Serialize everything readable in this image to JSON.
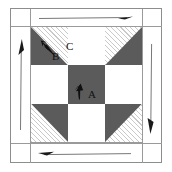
{
  "figure": {
    "colors": {
      "dark_patch": "#5b5b5b",
      "light_patch": "#ffffff",
      "hatched_patch": "#f4f4f4",
      "hatch_line": "#c9c9c9",
      "frame_line": "#8d8d8d",
      "arrow": "#1a1a1a",
      "label_text": "#111111"
    },
    "frame": {
      "outer_label": "outer border frame",
      "inner_label": "inner block frame"
    }
  },
  "labels": [
    {
      "id": "A",
      "text": "A",
      "location": "center patch",
      "note": "center dark square"
    },
    {
      "id": "B",
      "text": "B",
      "location": "top-left corner unit",
      "note": "dark triangle half"
    },
    {
      "id": "C",
      "text": "C",
      "location": "top-center patch",
      "note": "light square"
    }
  ],
  "grid": {
    "rows": 3,
    "cols": 3,
    "cells": [
      {
        "row": 0,
        "col": 0,
        "name": "corner-top-left",
        "type": "half-square-triangle",
        "fill": "hatched",
        "triangle": "bottom-left"
      },
      {
        "row": 0,
        "col": 1,
        "name": "edge-top-center",
        "type": "square",
        "fill": "light"
      },
      {
        "row": 0,
        "col": 2,
        "name": "corner-top-right",
        "type": "half-square-triangle",
        "fill": "hatched",
        "triangle": "bottom-right"
      },
      {
        "row": 1,
        "col": 0,
        "name": "edge-middle-left",
        "type": "square",
        "fill": "light"
      },
      {
        "row": 1,
        "col": 1,
        "name": "center-patch",
        "type": "square",
        "fill": "dark"
      },
      {
        "row": 1,
        "col": 2,
        "name": "edge-middle-right",
        "type": "square",
        "fill": "light"
      },
      {
        "row": 2,
        "col": 0,
        "name": "corner-bottom-left",
        "type": "half-square-triangle",
        "fill": "hatched",
        "triangle": "top-right"
      },
      {
        "row": 2,
        "col": 1,
        "name": "edge-bottom-center",
        "type": "square",
        "fill": "light"
      },
      {
        "row": 2,
        "col": 2,
        "name": "corner-bottom-right",
        "type": "half-square-triangle",
        "fill": "hatched",
        "triangle": "top-left"
      }
    ]
  },
  "arrows": [
    {
      "id": "top",
      "name": "top-border-arrow",
      "direction": "right",
      "placement": "top border strip"
    },
    {
      "id": "right",
      "name": "right-border-arrow",
      "direction": "down",
      "placement": "right border strip"
    },
    {
      "id": "bottom",
      "name": "bottom-border-arrow",
      "direction": "left",
      "placement": "bottom border strip"
    },
    {
      "id": "left",
      "name": "left-border-arrow",
      "direction": "up",
      "placement": "left border strip"
    },
    {
      "id": "A",
      "name": "patch-a-arrow",
      "direction": "up",
      "placement": "center dark patch"
    },
    {
      "id": "B",
      "name": "patch-b-arrow",
      "direction": "up-left",
      "placement": "top-left corner unit"
    }
  ]
}
